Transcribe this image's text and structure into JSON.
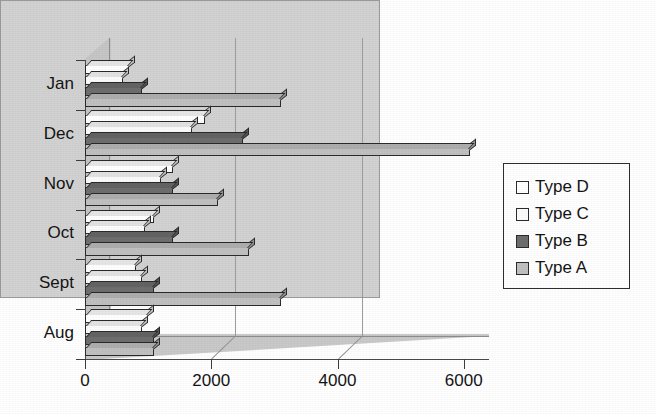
{
  "chart_data": {
    "type": "bar",
    "orientation": "horizontal",
    "style": "3d-grouped-bar",
    "title": "Games consoles sales",
    "xlabel": "",
    "ylabel": "",
    "categories": [
      "Jan",
      "Dec",
      "Nov",
      "Oct",
      "Sept",
      "Aug"
    ],
    "series": [
      {
        "name": "Type D",
        "color": "#ffffff",
        "values": [
          700,
          1900,
          1400,
          1100,
          800,
          1000
        ]
      },
      {
        "name": "Type C",
        "color": "#fbfbfb",
        "values": [
          600,
          1700,
          1200,
          950,
          900,
          900
        ]
      },
      {
        "name": "Type B",
        "color": "#6e6e6e",
        "values": [
          900,
          2500,
          1400,
          1400,
          1100,
          1100
        ]
      },
      {
        "name": "Type A",
        "color": "#c0c0c0",
        "values": [
          3100,
          6100,
          2100,
          2600,
          3100,
          1100
        ]
      }
    ],
    "xlim": [
      0,
      6400
    ],
    "xticks": [
      0,
      2000,
      4000,
      6000
    ],
    "xtick_labels": [
      "0",
      "2000",
      "4000",
      "6000"
    ],
    "gridlines": [
      2000,
      4000
    ],
    "grid": true,
    "legend_position": "right",
    "legend_entries": [
      "Type D",
      "Type C",
      "Type B",
      "Type A"
    ],
    "plot_background": "#d2d2d2",
    "figure_background": "#ffffff"
  }
}
